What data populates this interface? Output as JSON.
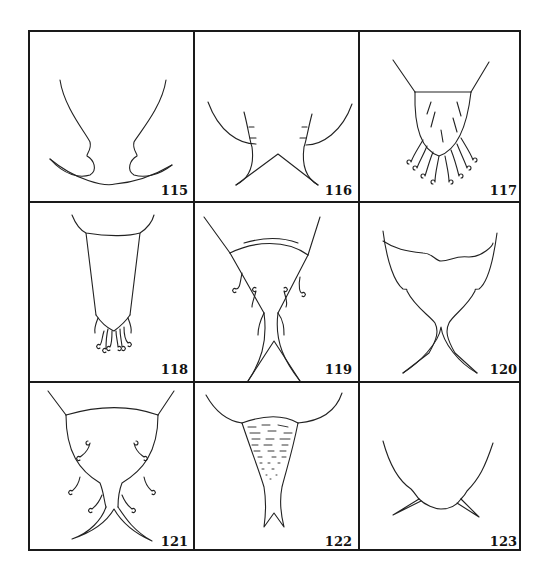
{
  "plate": {
    "layout": "3x3 grid of line drawings",
    "figures": [
      {
        "number": "115",
        "description": "Two curved lateral margins converging into a broad crescent-shaped lower lobe with notched inner edges"
      },
      {
        "number": "116",
        "description": "Two outer curved arms and two inner toothed margins converging to a V-shaped pair of points"
      },
      {
        "number": "117",
        "description": "Rounded tapering segment with internal striations and about ten hooked setae at apex"
      },
      {
        "number": "118",
        "description": "Long tapering segment with a cluster of small hooked setae at apex"
      },
      {
        "number": "119",
        "description": "Tapering segment with paired hooked setae along sides and two long slender apical processes"
      },
      {
        "number": "120",
        "description": "Heart-shaped segment with wavy upper margin and two crossed curved apical spines"
      },
      {
        "number": "121",
        "description": "Rounded segment with several pairs of hooked setae and two crossed apical spines"
      },
      {
        "number": "122",
        "description": "Funnel-shaped stippled segment tapering to a forked tip"
      },
      {
        "number": "123",
        "description": "U-shaped segment with a pair of small lateral spines near apex"
      }
    ]
  }
}
